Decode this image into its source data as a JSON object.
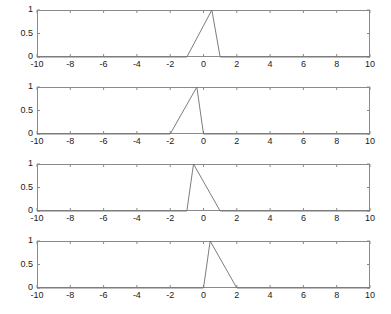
{
  "figure": {
    "background_color": "#ffffff",
    "axes_color": "#8a8a8a",
    "line_color": "#6e6e6e",
    "tick_label_color": "#1a1a1a",
    "subplot_count": 4
  },
  "chart_data": [
    {
      "type": "line",
      "title": "",
      "xlabel": "",
      "ylabel": "",
      "xlim": [
        -10,
        10
      ],
      "ylim": [
        0,
        1
      ],
      "grid": false,
      "legend": null,
      "xticks": [
        -10,
        -8,
        -6,
        -4,
        -2,
        0,
        2,
        4,
        6,
        8,
        10
      ],
      "xticklabels": [
        "-10",
        "-8",
        "-6",
        "-4",
        "-2",
        "0",
        "2",
        "4",
        "6",
        "8",
        "10"
      ],
      "yticks": [
        0,
        0.5,
        1
      ],
      "yticklabels": [
        "0",
        "0.5",
        "1"
      ],
      "series": [
        {
          "name": "triangular pulse",
          "x": [
            -10,
            -1,
            0.5,
            1,
            10
          ],
          "y": [
            0,
            0,
            1,
            0,
            0
          ]
        }
      ]
    },
    {
      "type": "line",
      "title": "",
      "xlabel": "",
      "ylabel": "",
      "xlim": [
        -10,
        10
      ],
      "ylim": [
        0,
        1
      ],
      "grid": false,
      "legend": null,
      "xticks": [
        -10,
        -8,
        -6,
        -4,
        -2,
        0,
        2,
        4,
        6,
        8,
        10
      ],
      "xticklabels": [
        "-10",
        "-8",
        "-6",
        "-4",
        "-2",
        "0",
        "2",
        "4",
        "6",
        "8",
        "10"
      ],
      "yticks": [
        0,
        0.5,
        1
      ],
      "yticklabels": [
        "0",
        "0.5",
        "1"
      ],
      "series": [
        {
          "name": "triangular pulse",
          "x": [
            -10,
            -2,
            -0.4,
            0,
            10
          ],
          "y": [
            0,
            0,
            1,
            0,
            0
          ]
        }
      ]
    },
    {
      "type": "line",
      "title": "",
      "xlabel": "",
      "ylabel": "",
      "xlim": [
        -10,
        10
      ],
      "ylim": [
        0,
        1
      ],
      "grid": false,
      "legend": null,
      "xticks": [
        -10,
        -8,
        -6,
        -4,
        -2,
        0,
        2,
        4,
        6,
        8,
        10
      ],
      "xticklabels": [
        "-10",
        "-8",
        "-6",
        "-4",
        "-2",
        "0",
        "2",
        "4",
        "6",
        "8",
        "10"
      ],
      "yticks": [
        0,
        0.5,
        1
      ],
      "yticklabels": [
        "0",
        "0.5",
        "1"
      ],
      "series": [
        {
          "name": "triangular pulse",
          "x": [
            -10,
            -1,
            -0.6,
            1,
            10
          ],
          "y": [
            0,
            0,
            1,
            0,
            0
          ]
        }
      ]
    },
    {
      "type": "line",
      "title": "",
      "xlabel": "",
      "ylabel": "",
      "xlim": [
        -10,
        10
      ],
      "ylim": [
        0,
        1
      ],
      "grid": false,
      "legend": null,
      "xticks": [
        -10,
        -8,
        -6,
        -4,
        -2,
        0,
        2,
        4,
        6,
        8,
        10
      ],
      "xticklabels": [
        "-10",
        "-8",
        "-6",
        "-4",
        "-2",
        "0",
        "2",
        "4",
        "6",
        "8",
        "10"
      ],
      "yticks": [
        0,
        0.5,
        1
      ],
      "yticklabels": [
        "0",
        "0.5",
        "1"
      ],
      "series": [
        {
          "name": "triangular pulse",
          "x": [
            -10,
            0,
            0.4,
            2,
            10
          ],
          "y": [
            0,
            0,
            1,
            0,
            0
          ]
        }
      ]
    }
  ],
  "layout": {
    "plot_left": 37,
    "plot_width": 333,
    "plot_height": 47,
    "subplot_tops": [
      10,
      87,
      164,
      241
    ]
  }
}
